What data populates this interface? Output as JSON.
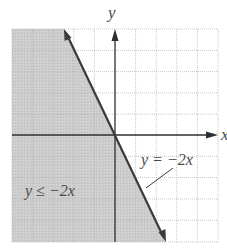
{
  "graph": {
    "axis_labels": {
      "x": "x",
      "y": "y"
    },
    "boundary_label": "y = −2x",
    "region_label": "y ≤ −2x",
    "grid": {
      "columns": 10,
      "rows": 10,
      "x_range": [
        -5,
        5
      ],
      "y_range": [
        -5,
        5
      ]
    },
    "boundary_line": {
      "slope": -2,
      "intercept": 0,
      "style": "solid"
    },
    "shaded_side": "below-left",
    "colors": {
      "shade": "#c8c8c8",
      "grid": "#b5b5b5",
      "axes": "#2f2f2f",
      "line": "#3a3a3a"
    }
  }
}
